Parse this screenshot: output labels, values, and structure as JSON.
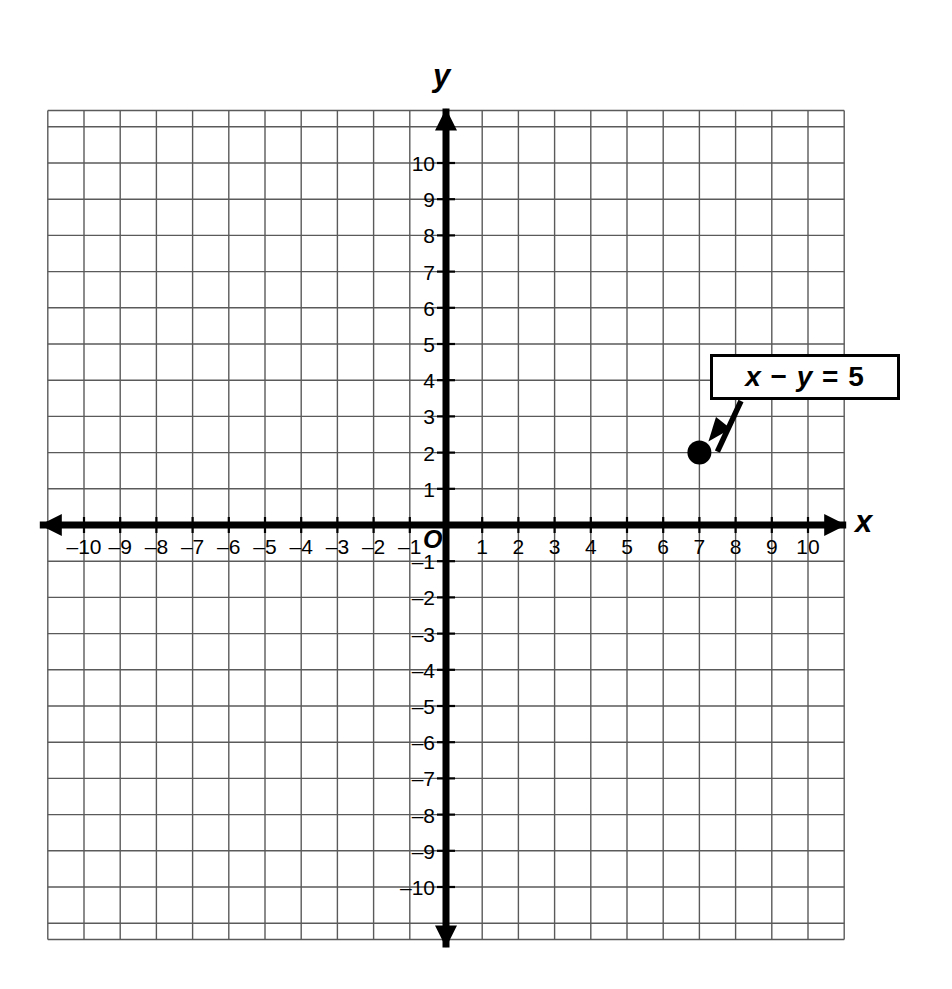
{
  "chart_data": {
    "type": "scatter",
    "title": "",
    "xlabel": "x",
    "ylabel": "y",
    "xlim": [
      -11,
      11
    ],
    "ylim": [
      -11,
      11
    ],
    "grid": true,
    "grid_step": 1,
    "legend": "none",
    "x_tick_labels": [
      "–10",
      "–9",
      "–8",
      "–7",
      "–6",
      "–5",
      "–4",
      "–3",
      "–2",
      "–1",
      "1",
      "2",
      "3",
      "4",
      "5",
      "6",
      "7",
      "8",
      "9",
      "10"
    ],
    "x_tick_values": [
      -10,
      -9,
      -8,
      -7,
      -6,
      -5,
      -4,
      -3,
      -2,
      -1,
      1,
      2,
      3,
      4,
      5,
      6,
      7,
      8,
      9,
      10
    ],
    "y_tick_labels": [
      "10",
      "9",
      "8",
      "7",
      "6",
      "5",
      "4",
      "3",
      "2",
      "1",
      "–1",
      "–2",
      "–3",
      "–4",
      "–5",
      "–6",
      "–7",
      "–8",
      "–9",
      "–10"
    ],
    "y_tick_values": [
      10,
      9,
      8,
      7,
      6,
      5,
      4,
      3,
      2,
      1,
      -1,
      -2,
      -3,
      -4,
      -5,
      -6,
      -7,
      -8,
      -9,
      -10
    ],
    "origin_label": "O",
    "points": [
      {
        "x": 7,
        "y": 2,
        "label": "",
        "marker": "filled-circle",
        "color": "#000000"
      }
    ],
    "annotations": [
      {
        "text": "x − y = 5",
        "text_parts": [
          {
            "t": "x",
            "italic": true
          },
          {
            "t": " − ",
            "italic": false
          },
          {
            "t": "y",
            "italic": true
          },
          {
            "t": " = 5",
            "italic": false
          }
        ],
        "style": "boxed-callout-with-arrow",
        "points_to": {
          "x": 7,
          "y": 2
        }
      }
    ],
    "colors": {
      "grid": "#5a5a5a",
      "axis": "#000000",
      "background": "#ffffff",
      "point": "#000000",
      "callout_border": "#000000"
    }
  }
}
